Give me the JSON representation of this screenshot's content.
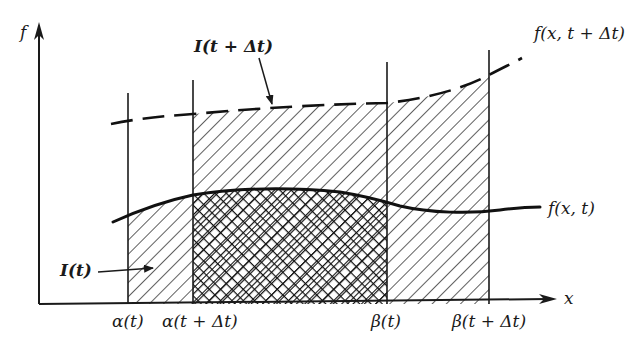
{
  "figure": {
    "type": "diagram",
    "axes": {
      "y_label": "f",
      "x_label": "x"
    },
    "curves": {
      "solid_label": "f(x, t)",
      "dashed_label": "f(x, t + Δt)"
    },
    "regions": {
      "I_t_label": "I(t)",
      "I_t_dt_label": "I(t + Δt)"
    },
    "x_ticks": [
      {
        "label": "α(t)"
      },
      {
        "label": "α(t + Δt)"
      },
      {
        "label": "β(t)"
      },
      {
        "label": "β(t + Δt)"
      }
    ],
    "colors": {
      "ink": "#1a1a1a",
      "background": "#ffffff"
    }
  }
}
